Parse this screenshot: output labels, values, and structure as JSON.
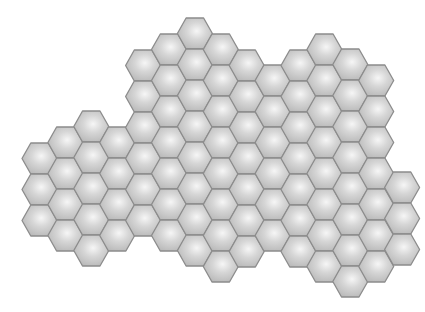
{
  "board": {
    "label": "Hexagon tile board",
    "hex": {
      "width": 35,
      "height": 31,
      "col_step": 25.9,
      "origin_x": 22
    },
    "colors": {
      "fill_light": "#f6f6f6",
      "fill_mid": "#d6d6d6",
      "fill_dark": "#b9b9b9",
      "stroke": "#8c8c8c",
      "background": "#ffffff"
    },
    "columns": [
      {
        "col": 0,
        "top": 143,
        "count": 3
      },
      {
        "col": 1,
        "top": 127,
        "count": 4
      },
      {
        "col": 2,
        "top": 111,
        "count": 5
      },
      {
        "col": 3,
        "top": 127,
        "count": 4
      },
      {
        "col": 4,
        "top": 50,
        "count": 6
      },
      {
        "col": 5,
        "top": 34,
        "count": 7
      },
      {
        "col": 6,
        "top": 18,
        "count": 8
      },
      {
        "col": 7,
        "top": 34,
        "count": 8
      },
      {
        "col": 8,
        "top": 50,
        "count": 7
      },
      {
        "col": 9,
        "top": 65,
        "count": 6
      },
      {
        "col": 10,
        "top": 50,
        "count": 7
      },
      {
        "col": 11,
        "top": 34,
        "count": 8
      },
      {
        "col": 12,
        "top": 49,
        "count": 8
      },
      {
        "col": 13,
        "top": 65,
        "count": 7
      },
      {
        "col": 14,
        "top": 172,
        "count": 3
      }
    ]
  }
}
